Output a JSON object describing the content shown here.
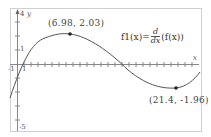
{
  "graph": {
    "function_definition": {
      "name": "f1(x)",
      "equals": "=",
      "numerator": "d",
      "denominator": "dx",
      "argument": "(f(x))"
    },
    "x_axis_label": "x",
    "y_axis_label": "y",
    "y_max_label": "4",
    "y_min_label": "-5",
    "y_tick_label": "1",
    "x_neg_label": "-1",
    "x_pos_label": "1",
    "points": [
      {
        "label": "(6.98, 2.03)",
        "kind": "maximum"
      },
      {
        "label": "(21.4, -1.96)",
        "kind": "minimum"
      }
    ],
    "colors": {
      "curve": "#555555",
      "axis": "#888888",
      "frame": "#cccccc",
      "text": "#444444"
    }
  }
}
